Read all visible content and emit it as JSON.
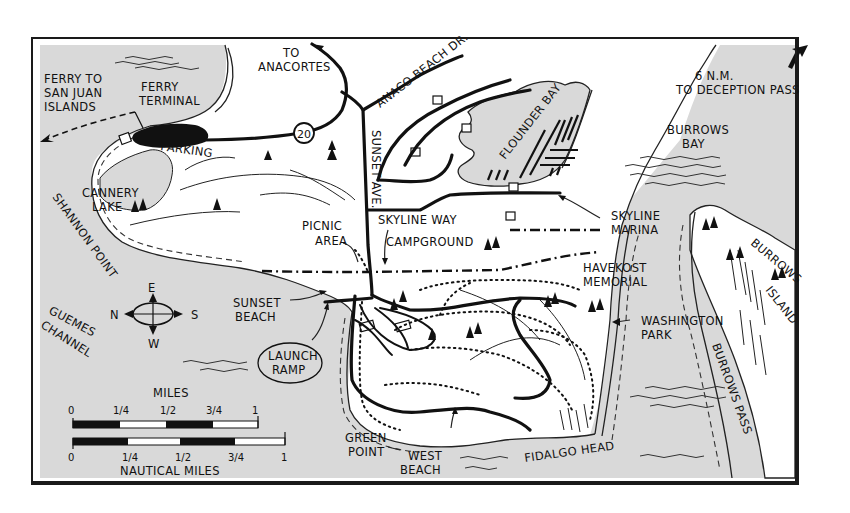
{
  "map": {
    "title_area": "Fidalgo Head / Washington Park area",
    "colors": {
      "water": "#d9d9d9",
      "land": "#ffffff",
      "ink": "#111111",
      "frame": "#1a1a1a"
    },
    "labels": {
      "ferry_to_1": "FERRY TO",
      "ferry_to_2": "SAN JUAN",
      "ferry_to_3": "ISLANDS",
      "ferry_terminal_1": "FERRY",
      "ferry_terminal_2": "TERMINAL",
      "to_anacortes_1": "TO",
      "to_anacortes_2": "ANACORTES",
      "anaco_beach_dr": "ANACO BEACH DR.",
      "deception_1": "6 N.M.",
      "deception_2": "TO DECEPTION PASS",
      "flounder_bay": "FLOUNDER BAY",
      "burrows_bay_1": "BURROWS",
      "burrows_bay_2": "BAY",
      "parking": "PARKING",
      "route_shield": "20",
      "sunset_ave": "SUNSET AVE.",
      "cannery_1": "CANNERY",
      "cannery_2": "LAKE",
      "shannon_point": "SHANNON POINT",
      "picnic_1": "PICNIC",
      "picnic_2": "AREA",
      "skyline_way": "SKYLINE WAY",
      "campground": "CAMPGROUND",
      "skyline_marina_1": "SKYLINE",
      "skyline_marina_2": "MARINA",
      "burrows_island_1": "BURROWS",
      "burrows_island_2": "ISLAND",
      "havekost_1": "HAVEKOST",
      "havekost_2": "MEMORIAL",
      "washington_1": "WASHINGTON",
      "washington_2": "PARK",
      "sunset_beach_1": "SUNSET",
      "sunset_beach_2": "BEACH",
      "guemes_1": "GUEMES",
      "guemes_2": "CHANNEL",
      "launch_1": "LAUNCH",
      "launch_2": "RAMP",
      "burrows_pass": "BURROWS PASS",
      "green_point_1": "GREEN",
      "green_point_2": "POINT",
      "west_beach_1": "WEST",
      "west_beach_2": "BEACH",
      "fidalgo_head": "FIDALGO HEAD"
    },
    "compass": {
      "top": "E",
      "left": "N",
      "right": "S",
      "bottom": "W"
    },
    "scale": {
      "miles_title": "MILES",
      "miles_ticks": [
        "0",
        "1/4",
        "1/2",
        "3/4",
        "1"
      ],
      "nautical_title": "NAUTICAL MILES",
      "nautical_ticks": [
        "0",
        "1/4",
        "1/2",
        "3/4",
        "1"
      ]
    }
  }
}
